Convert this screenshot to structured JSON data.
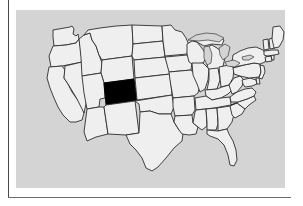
{
  "figure": {
    "type": "locator-map",
    "caption": "",
    "region": "Contiguous United States",
    "projection_note": "",
    "background_color": "#d4d4d4",
    "state_fill_color": "#efefef",
    "state_border_color": "#2e2e2e",
    "highlight_color": "#000000",
    "frame_color": "#4a4a4a",
    "page_color": "#ffffff"
  },
  "highlight": {
    "state_name": "Colorado",
    "state_abbr": "CO",
    "label": "",
    "is_highlighted": true
  },
  "legend": {
    "visible": false,
    "entries": []
  },
  "frame": {
    "left_rule_visible": true,
    "bottom_rule_visible": true,
    "top_rule_visible": false,
    "right_rule_visible": false
  },
  "map": {
    "feature_count": 49,
    "lakes_visible": true,
    "labels_visible": false,
    "states": [
      {
        "abbr": "WA",
        "name": "Washington",
        "highlighted": false
      },
      {
        "abbr": "OR",
        "name": "Oregon",
        "highlighted": false
      },
      {
        "abbr": "CA",
        "name": "California",
        "highlighted": false
      },
      {
        "abbr": "NV",
        "name": "Nevada",
        "highlighted": false
      },
      {
        "abbr": "ID",
        "name": "Idaho",
        "highlighted": false
      },
      {
        "abbr": "MT",
        "name": "Montana",
        "highlighted": false
      },
      {
        "abbr": "WY",
        "name": "Wyoming",
        "highlighted": false
      },
      {
        "abbr": "UT",
        "name": "Utah",
        "highlighted": false
      },
      {
        "abbr": "AZ",
        "name": "Arizona",
        "highlighted": false
      },
      {
        "abbr": "CO",
        "name": "Colorado",
        "highlighted": true
      },
      {
        "abbr": "NM",
        "name": "New Mexico",
        "highlighted": false
      },
      {
        "abbr": "ND",
        "name": "North Dakota",
        "highlighted": false
      },
      {
        "abbr": "SD",
        "name": "South Dakota",
        "highlighted": false
      },
      {
        "abbr": "NE",
        "name": "Nebraska",
        "highlighted": false
      },
      {
        "abbr": "KS",
        "name": "Kansas",
        "highlighted": false
      },
      {
        "abbr": "OK",
        "name": "Oklahoma",
        "highlighted": false
      },
      {
        "abbr": "TX",
        "name": "Texas",
        "highlighted": false
      },
      {
        "abbr": "MN",
        "name": "Minnesota",
        "highlighted": false
      },
      {
        "abbr": "IA",
        "name": "Iowa",
        "highlighted": false
      },
      {
        "abbr": "MO",
        "name": "Missouri",
        "highlighted": false
      },
      {
        "abbr": "AR",
        "name": "Arkansas",
        "highlighted": false
      },
      {
        "abbr": "LA",
        "name": "Louisiana",
        "highlighted": false
      },
      {
        "abbr": "WI",
        "name": "Wisconsin",
        "highlighted": false
      },
      {
        "abbr": "IL",
        "name": "Illinois",
        "highlighted": false
      },
      {
        "abbr": "MI",
        "name": "Michigan",
        "highlighted": false
      },
      {
        "abbr": "IN",
        "name": "Indiana",
        "highlighted": false
      },
      {
        "abbr": "OH",
        "name": "Ohio",
        "highlighted": false
      },
      {
        "abbr": "KY",
        "name": "Kentucky",
        "highlighted": false
      },
      {
        "abbr": "TN",
        "name": "Tennessee",
        "highlighted": false
      },
      {
        "abbr": "MS",
        "name": "Mississippi",
        "highlighted": false
      },
      {
        "abbr": "AL",
        "name": "Alabama",
        "highlighted": false
      },
      {
        "abbr": "GA",
        "name": "Georgia",
        "highlighted": false
      },
      {
        "abbr": "FL",
        "name": "Florida",
        "highlighted": false
      },
      {
        "abbr": "SC",
        "name": "South Carolina",
        "highlighted": false
      },
      {
        "abbr": "NC",
        "name": "North Carolina",
        "highlighted": false
      },
      {
        "abbr": "VA",
        "name": "Virginia",
        "highlighted": false
      },
      {
        "abbr": "WV",
        "name": "West Virginia",
        "highlighted": false
      },
      {
        "abbr": "MD",
        "name": "Maryland",
        "highlighted": false
      },
      {
        "abbr": "DE",
        "name": "Delaware",
        "highlighted": false
      },
      {
        "abbr": "PA",
        "name": "Pennsylvania",
        "highlighted": false
      },
      {
        "abbr": "NJ",
        "name": "New Jersey",
        "highlighted": false
      },
      {
        "abbr": "NY",
        "name": "New York",
        "highlighted": false
      },
      {
        "abbr": "CT",
        "name": "Connecticut",
        "highlighted": false
      },
      {
        "abbr": "RI",
        "name": "Rhode Island",
        "highlighted": false
      },
      {
        "abbr": "MA",
        "name": "Massachusetts",
        "highlighted": false
      },
      {
        "abbr": "VT",
        "name": "Vermont",
        "highlighted": false
      },
      {
        "abbr": "NH",
        "name": "New Hampshire",
        "highlighted": false
      },
      {
        "abbr": "ME",
        "name": "Maine",
        "highlighted": false
      }
    ],
    "lakes": [
      {
        "name": "Lake Superior"
      },
      {
        "name": "Lake Michigan"
      },
      {
        "name": "Lake Huron"
      },
      {
        "name": "Lake Erie"
      },
      {
        "name": "Lake Ontario"
      }
    ]
  }
}
